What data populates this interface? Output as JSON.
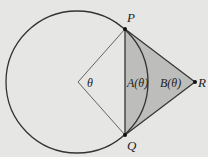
{
  "diagram": {
    "background": "#e6e6e4",
    "stroke_color": "#333333",
    "shade_color": "#bdbdbb",
    "labels": {
      "P": "P",
      "Q": "Q",
      "R": "R",
      "theta": "θ",
      "A": "A(θ)",
      "B": "B(θ)"
    },
    "points": {
      "center": [
        78,
        82
      ],
      "P": [
        125,
        29
      ],
      "Q": [
        125,
        135
      ],
      "R": [
        195,
        82
      ]
    },
    "circle_radius": 71
  }
}
